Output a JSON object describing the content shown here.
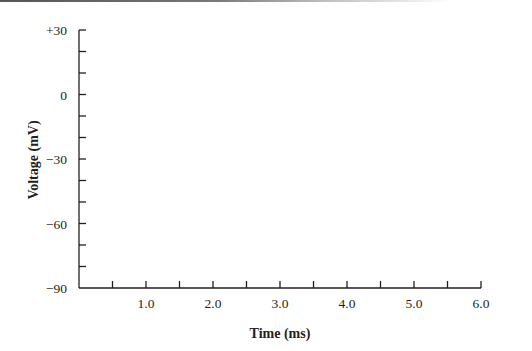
{
  "chart_data": {
    "type": "line",
    "title": "",
    "xlabel": "Time (ms)",
    "ylabel": "Voltage (mV)",
    "xlim": [
      0,
      6.0
    ],
    "ylim": [
      -90,
      30
    ],
    "x_ticks_major": [
      1.0,
      2.0,
      3.0,
      4.0,
      5.0,
      6.0
    ],
    "x_tick_labels": [
      "1.0",
      "2.0",
      "3.0",
      "4.0",
      "5.0",
      "6.0"
    ],
    "x_ticks_minor": [
      0.5,
      1.5,
      2.5,
      3.5,
      4.5,
      5.5
    ],
    "y_ticks_major": [
      30,
      0,
      -30,
      -60,
      -90
    ],
    "y_tick_labels": [
      "+30",
      "0",
      "−30",
      "−60",
      "−90"
    ],
    "y_ticks_minor": [
      20,
      10,
      -10,
      -20,
      -40,
      -50,
      -70,
      -80
    ],
    "grid": false,
    "legend": null,
    "series": []
  },
  "colors": {
    "axis": "#231f20",
    "background": "#ffffff"
  }
}
